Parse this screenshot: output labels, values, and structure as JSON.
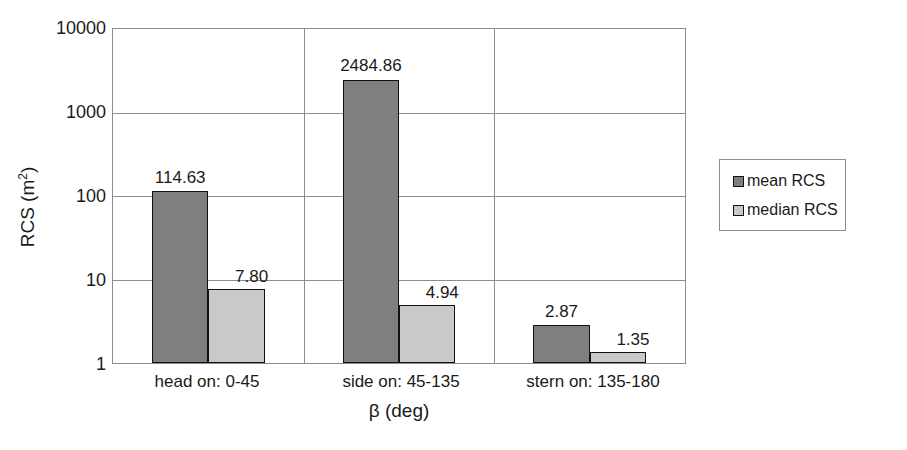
{
  "chart_data": {
    "type": "bar",
    "title": "",
    "subtitle": "",
    "xlabel": "β (deg)",
    "ylabel": "RCS (m²)",
    "ylabel_base": "RCS (m",
    "ylabel_sup": "2",
    "ylabel_close": ")",
    "yscale": "log",
    "ylim": [
      1,
      10000
    ],
    "yticks": [
      1,
      10,
      100,
      1000,
      10000
    ],
    "ytick_labels": [
      "1",
      "10",
      "100",
      "1000",
      "10000"
    ],
    "grid": "horizontal-and-category-dividers",
    "categories": [
      "head on:  0-45",
      "side on: 45-135",
      "stern on: 135-180"
    ],
    "series": [
      {
        "name": "mean RCS",
        "color": "#7f7f7f",
        "values": [
          114.63,
          2484.86,
          2.87
        ],
        "labels": [
          "114.63",
          "2484.86",
          "2.87"
        ]
      },
      {
        "name": "median RCS",
        "color": "#c9c9c9",
        "values": [
          7.8,
          4.94,
          1.35
        ],
        "labels": [
          "7.80",
          "4.94",
          "1.35"
        ]
      }
    ],
    "legend": {
      "position": "right",
      "entries": [
        "mean RCS",
        "median RCS"
      ]
    }
  },
  "axis": {
    "y_tick_0": "10000",
    "y_tick_1": "1000",
    "y_tick_2": "100",
    "y_tick_3": "10",
    "y_tick_4": "1"
  },
  "bars": {
    "g1_mean_label": "114.63",
    "g1_median_label": "7.80",
    "g2_mean_label": "2484.86",
    "g2_median_label": "4.94",
    "g3_mean_label": "2.87",
    "g3_median_label": "1.35"
  },
  "categories": {
    "c1": "head on:  0-45",
    "c2": "side on: 45-135",
    "c3": "stern on: 135-180"
  },
  "legend": {
    "mean_label": "mean RCS",
    "median_label": "median RCS"
  },
  "colors": {
    "mean": "#7f7f7f",
    "median": "#c9c9c9",
    "grid": "#8d8d8d",
    "bar_outline": "#111111",
    "text": "#1a1a1a",
    "background": "#ffffff"
  }
}
